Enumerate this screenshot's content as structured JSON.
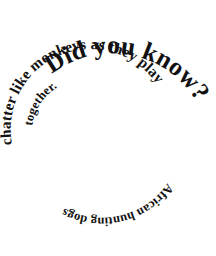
{
  "image": {
    "kind": "spiral-text-graphic",
    "background_color": "#ffffff",
    "text_color": "#111111",
    "width": 216,
    "height": 256,
    "full_text": "Did you know? African hunting dogs chatter like monkeys as they play together."
  },
  "rings": {
    "outer": {
      "id": "ring-outer",
      "text": "Did you know?",
      "description": "largest serif text forming the top outer arc, running clockwise from upper-left to right side"
    },
    "middle": {
      "id": "ring-middle",
      "text": "chatter like monkeys as they play",
      "description": "medium serif text forming the second concentric arc"
    },
    "inner": {
      "id": "ring-inner",
      "text": "African hunting dogs",
      "description": "small serif text forming the lower inner arc, rendered upside down along the bottom"
    },
    "innermost": {
      "id": "ring-innermost",
      "text": "together.",
      "description": "smallest fragment near the centre-left, closing the sentence"
    }
  },
  "words": {
    "w1": "Did",
    "w2": "you",
    "w3": "know?",
    "w4": "African",
    "w5": "hunting",
    "w6": "dogs",
    "w7": "chatter",
    "w8": "like",
    "w9": "monkeys",
    "w10": "as",
    "w11": "they",
    "w12": "play",
    "w13": "together."
  },
  "colors": {
    "ink": "#111111",
    "paper": "#ffffff"
  }
}
